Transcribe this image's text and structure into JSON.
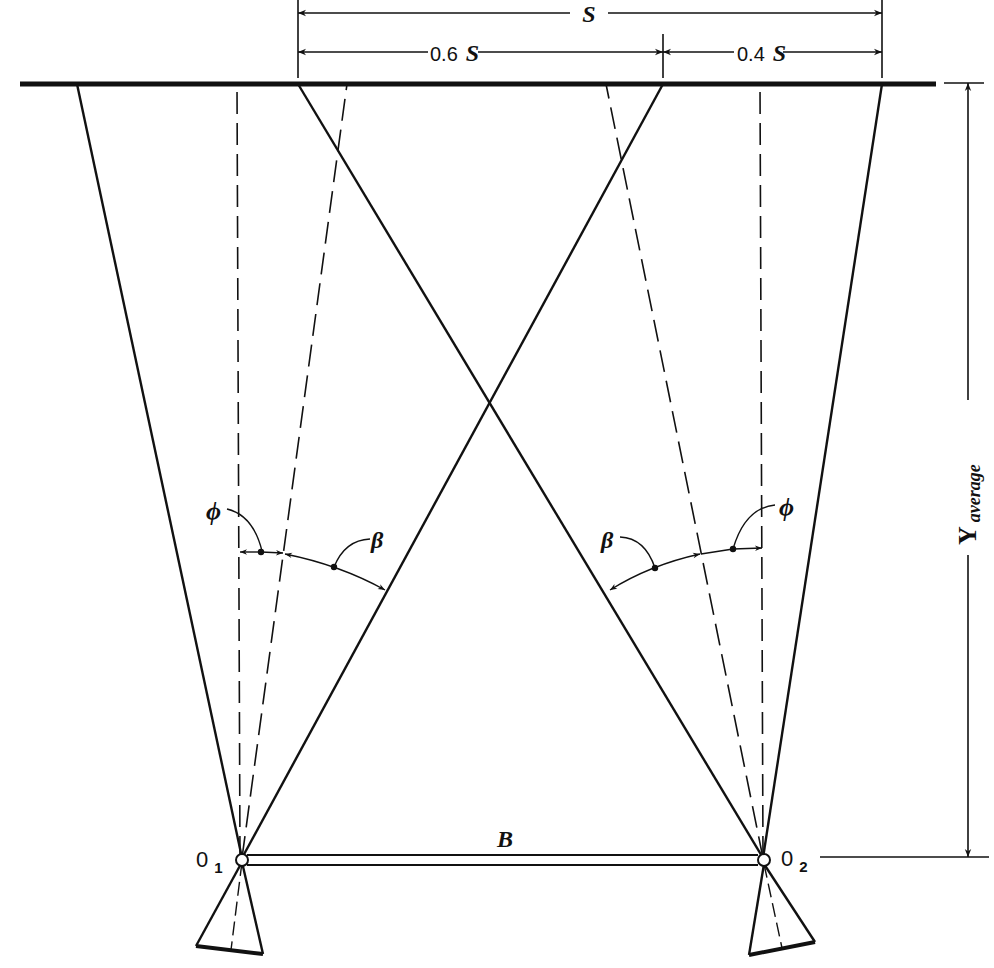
{
  "figure": {
    "type": "photogrammetry stereo-overlap diagram",
    "colors": {
      "ink": "#111111",
      "background": "#ffffff"
    }
  },
  "dimensions": {
    "total": {
      "label": "S"
    },
    "left_part": {
      "label_num": "0.6",
      "label_var": "S"
    },
    "right_part": {
      "label_num": "0.4",
      "label_var": "S"
    }
  },
  "angles": {
    "left": {
      "phi": "ϕ",
      "beta": "β"
    },
    "right": {
      "phi": "ϕ",
      "beta": "β"
    }
  },
  "stations": {
    "left": {
      "label": "0",
      "subscript": "1"
    },
    "right": {
      "label": "0",
      "subscript": "2"
    }
  },
  "baseline": {
    "label": "B"
  },
  "height": {
    "label": "Y",
    "subscript": "average"
  }
}
